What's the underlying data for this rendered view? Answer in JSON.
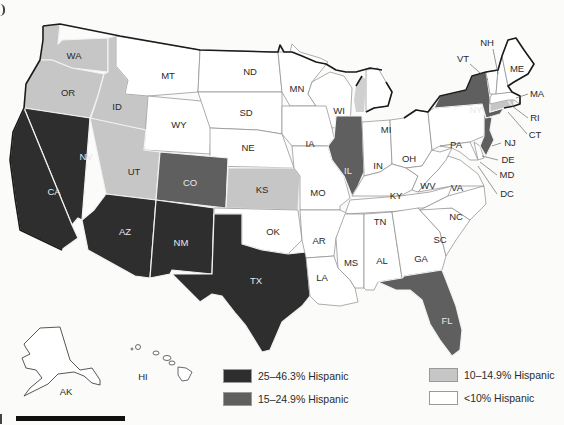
{
  "map": {
    "type": "choropleth",
    "region": "United States",
    "colors": {
      "25-46.3": "#2e2e2e",
      "15-24.9": "#5f5f5f",
      "10-14.9": "#c6c6c6",
      "lt10": "#ffffff"
    },
    "legend": [
      {
        "label": "25–46.3% Hispanic",
        "color": "#2e2e2e"
      },
      {
        "label": "15–24.9% Hispanic",
        "color": "#5f5f5f"
      },
      {
        "label": "10–14.9% Hispanic",
        "color": "#c6c6c6"
      },
      {
        "label": "<10% Hispanic",
        "color": "#ffffff"
      }
    ],
    "states": {
      "WA": "10-14.9",
      "OR": "10-14.9",
      "ID": "10-14.9",
      "MT": "lt10",
      "WY": "lt10",
      "ND": "lt10",
      "SD": "lt10",
      "NE": "lt10",
      "MN": "lt10",
      "WI": "lt10",
      "MI": "lt10",
      "IA": "lt10",
      "IL": "15-24.9",
      "IN": "lt10",
      "OH": "lt10",
      "PA": "lt10",
      "NY": "15-24.9",
      "VT": "lt10",
      "NH": "lt10",
      "ME": "lt10",
      "MA": "lt10",
      "RI": "10-14.9",
      "CT": "10-14.9",
      "NJ": "15-24.9",
      "DE": "lt10",
      "MD": "lt10",
      "DC": "lt10",
      "VA": "lt10",
      "WV": "lt10",
      "KY": "lt10",
      "TN": "lt10",
      "NC": "lt10",
      "SC": "lt10",
      "GA": "lt10",
      "AL": "lt10",
      "MS": "lt10",
      "LA": "lt10",
      "AR": "lt10",
      "MO": "lt10",
      "KS": "10-14.9",
      "OK": "lt10",
      "TX": "25-46.3",
      "NM": "25-46.3",
      "AZ": "25-46.3",
      "CA": "25-46.3",
      "NV": "25-46.3",
      "UT": "10-14.9",
      "CO": "15-24.9",
      "FL": "15-24.9",
      "AK": "lt10",
      "HI": "lt10"
    },
    "labels": {
      "WA": "WA",
      "OR": "OR",
      "ID": "ID",
      "MT": "MT",
      "WY": "WY",
      "ND": "ND",
      "SD": "SD",
      "NE": "NE",
      "MN": "MN",
      "WI": "WI",
      "MI": "MI",
      "IA": "IA",
      "IL": "IL",
      "IN": "IN",
      "OH": "OH",
      "PA": "PA",
      "NY": "NY",
      "VT": "VT",
      "NH": "NH",
      "ME": "ME",
      "MA": "MA",
      "RI": "RI",
      "CT": "CT",
      "NJ": "NJ",
      "DE": "DE",
      "MD": "MD",
      "DC": "DC",
      "VA": "VA",
      "WV": "WV",
      "KY": "KY",
      "TN": "TN",
      "NC": "NC",
      "SC": "SC",
      "GA": "GA",
      "AL": "AL",
      "MS": "MS",
      "LA": "LA",
      "AR": "AR",
      "MO": "MO",
      "KS": "KS",
      "OK": "OK",
      "TX": "TX",
      "NM": "NM",
      "AZ": "AZ",
      "CA": "CA",
      "NV": "NV",
      "UT": "UT",
      "CO": "CO",
      "FL": "FL",
      "AK": "AK",
      "HI": "HI"
    }
  }
}
